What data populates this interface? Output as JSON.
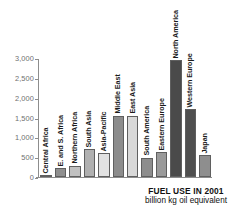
{
  "chart_data": {
    "type": "bar",
    "title": "FUEL USE IN 2001",
    "subtitle": "billion kg oil equivalent",
    "xlabel": "",
    "ylabel": "",
    "ylim": [
      0,
      3000
    ],
    "grid": false,
    "legend": "none",
    "ytick_labels": [
      "3,000",
      "2,500",
      "2,000",
      "1,500",
      "1,000",
      "500",
      "0"
    ],
    "ytick_values": [
      3000,
      2500,
      2000,
      1500,
      1000,
      500,
      0
    ],
    "categories": [
      "Central Africa",
      "E. and S. Africa",
      "Northern Africa",
      "South Asia",
      "Asia-Pacific",
      "Middle East",
      "East Asia",
      "South America",
      "Eastern Europe",
      "North America",
      "Western Europe",
      "Japan"
    ],
    "values": [
      40,
      230,
      290,
      710,
      610,
      1550,
      1550,
      490,
      640,
      2950,
      1720,
      550
    ],
    "bar_colors": [
      "#b4b4b4",
      "#8f8f8f",
      "#c0c0c0",
      "#b0b0b0",
      "#e2e2e2",
      "#8c8c8c",
      "#d8d8d8",
      "#8d8d8d",
      "#9a9a9a",
      "#4a4a4a",
      "#4f4f4f",
      "#8e8e8e"
    ]
  },
  "colors": {
    "axis": "#8d8d8d",
    "tick_text": "#6f6f6f",
    "caption_text": "#111111",
    "background": "#ffffff"
  }
}
